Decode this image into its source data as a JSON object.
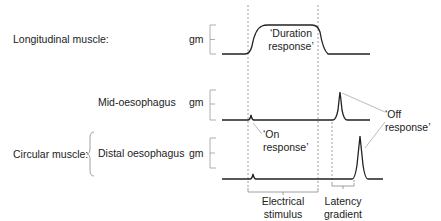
{
  "rows": {
    "longitudinal": {
      "label": "Longitudinal muscle:",
      "unit": "gm"
    },
    "circular": {
      "label": "Circular muscle:"
    },
    "mid": {
      "label": "Mid-oesophagus",
      "unit": "gm"
    },
    "distal": {
      "label": "Distal oesophagus",
      "unit": "gm"
    }
  },
  "annotations": {
    "duration_line1": "‘Duration",
    "duration_line2": "response’",
    "on_line1": "‘On",
    "on_line2": "response’",
    "off_line1": "‘Off",
    "off_line2": "response’"
  },
  "brackets": {
    "stimulus_line1": "Electrical",
    "stimulus_line2": "stimulus",
    "latency_line1": "Latency",
    "latency_line2": "gradient"
  },
  "colors": {
    "trace": "#222222",
    "guide": "#888888",
    "pointer": "#aaaaaa",
    "text": "#222222"
  }
}
